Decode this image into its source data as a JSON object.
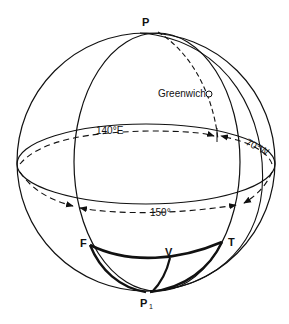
{
  "diagram": {
    "type": "celestial/terrestrial sphere great-circle diagram",
    "labels": {
      "north_pole": "P",
      "south_pole": "P",
      "south_pole_subscript": "1",
      "greenwich": "Greenwich",
      "from_point": "F",
      "to_point": "T",
      "vertex": "V",
      "longitude_east": "140°E",
      "longitude_west": "70°W",
      "dlong": "150°"
    },
    "colors": {
      "line": "#111111",
      "background": "#ffffff"
    }
  }
}
